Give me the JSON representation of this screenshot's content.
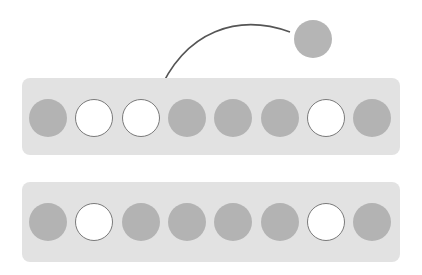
{
  "colors": {
    "filled": "#b3b3b3",
    "empty": "#ffffff",
    "empty_border": "#7a7a7a",
    "bar": "#e2e2e2",
    "arrow": "#555555"
  },
  "floating_circle": {
    "state": "filled"
  },
  "arrow": {
    "from": "floating-circle",
    "to": "top-row-slot-3"
  },
  "rows": [
    {
      "name": "top-row",
      "slots": [
        "filled",
        "empty",
        "empty",
        "filled",
        "filled",
        "filled",
        "empty",
        "filled"
      ]
    },
    {
      "name": "bottom-row",
      "slots": [
        "filled",
        "empty",
        "filled",
        "filled",
        "filled",
        "filled",
        "empty",
        "filled"
      ]
    }
  ]
}
